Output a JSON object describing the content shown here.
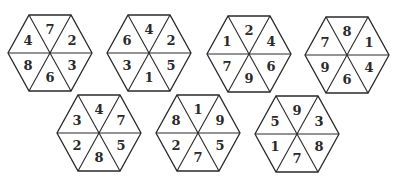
{
  "puzzle": {
    "sector_order": [
      "top",
      "top-right",
      "bottom-right",
      "bottom",
      "bottom-left",
      "top-left"
    ],
    "hexagons": [
      {
        "id": 1,
        "cx": 50,
        "cy": 53,
        "numbers": [
          "7",
          "2",
          "3",
          "6",
          "8",
          "4"
        ]
      },
      {
        "id": 2,
        "cx": 149,
        "cy": 53,
        "numbers": [
          "4",
          "2",
          "5",
          "1",
          "3",
          "6"
        ]
      },
      {
        "id": 3,
        "cx": 249,
        "cy": 54,
        "numbers": [
          "2",
          "4",
          "6",
          "9",
          "7",
          "1"
        ]
      },
      {
        "id": 4,
        "cx": 347,
        "cy": 55,
        "numbers": [
          "8",
          "1",
          "4",
          "6",
          "9",
          "7"
        ]
      },
      {
        "id": 5,
        "cx": 99,
        "cy": 133,
        "numbers": [
          "4",
          "7",
          "5",
          "8",
          "2",
          "3"
        ]
      },
      {
        "id": 6,
        "cx": 198,
        "cy": 133,
        "numbers": [
          "1",
          "9",
          "5",
          "7",
          "2",
          "8"
        ]
      },
      {
        "id": 7,
        "cx": 297,
        "cy": 134,
        "numbers": [
          "9",
          "3",
          "8",
          "7",
          "1",
          "5"
        ]
      }
    ],
    "radius": 42,
    "half_height": 38,
    "line_color": "#2a2a2a"
  }
}
